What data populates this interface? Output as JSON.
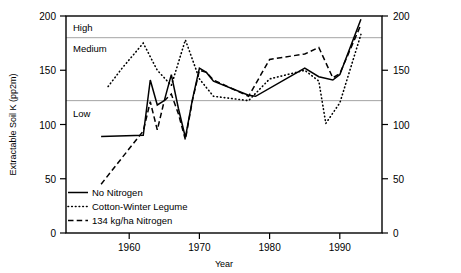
{
  "chart_data": {
    "type": "line",
    "title": "",
    "xlabel": "Year",
    "ylabel": "Extractable Soil K (pp2m)",
    "xlim": [
      1951,
      1996
    ],
    "ylim": [
      0,
      200
    ],
    "xticks": [
      1960,
      1970,
      1980,
      1990
    ],
    "yticks": [
      0,
      50,
      100,
      150,
      200
    ],
    "yticks_right": [
      0,
      50,
      100,
      150,
      200
    ],
    "grid": "horizontal gridlines at 122 and 180",
    "legend_position": "lower-left inside axes",
    "annotations": [
      {
        "label": "High",
        "y": 190,
        "note": "zone above 180 gridline"
      },
      {
        "label": "Medium",
        "y": 172,
        "note": "zone between 122 and 180"
      },
      {
        "label": "Low",
        "y": 110,
        "note": "zone below 122 gridline"
      }
    ],
    "zone_gridlines": [
      122,
      180
    ],
    "series": [
      {
        "name": "No Nitrogen",
        "style": "solid",
        "x": [
          1956,
          1962,
          1963,
          1964,
          1965,
          1966,
          1967,
          1968,
          1969,
          1970,
          1971,
          1972,
          1977,
          1978,
          1985,
          1987,
          1989,
          1990,
          1993
        ],
        "values": [
          89,
          90,
          141,
          118,
          122,
          146,
          115,
          88,
          123,
          152,
          148,
          140,
          127,
          126,
          152,
          144,
          141,
          146,
          197
        ]
      },
      {
        "name": "Cotton-Winter Legume",
        "style": "dotted",
        "x": [
          1957,
          1959,
          1962,
          1964,
          1966,
          1968,
          1970,
          1972,
          1977,
          1980,
          1985,
          1987,
          1988,
          1990,
          1993
        ],
        "values": [
          135,
          152,
          175,
          150,
          136,
          178,
          142,
          126,
          122,
          142,
          150,
          140,
          101,
          120,
          183
        ]
      },
      {
        "name": "134 kg/ha Nitrogen",
        "style": "dashed",
        "x": [
          1956,
          1962,
          1963,
          1964,
          1965,
          1966,
          1967,
          1968,
          1969,
          1970,
          1971,
          1972,
          1977,
          1980,
          1985,
          1987,
          1989,
          1990,
          1993
        ],
        "values": [
          45,
          94,
          121,
          95,
          122,
          128,
          110,
          86,
          122,
          150,
          148,
          141,
          126,
          160,
          165,
          171,
          143,
          147,
          192
        ]
      }
    ]
  },
  "legend": {
    "items": [
      {
        "label": "No Nitrogen",
        "style": "solid"
      },
      {
        "label": "Cotton-Winter Legume",
        "style": "dotted"
      },
      {
        "label": "134 kg/ha Nitrogen",
        "style": "dashed"
      }
    ]
  },
  "axes": {
    "y_title": "Extractable Soil K (pp2m)",
    "x_title": "Year",
    "y_tick_labels": [
      "0",
      "50",
      "100",
      "150",
      "200"
    ],
    "y_tick_labels_right": [
      "0",
      "50",
      "100",
      "150",
      "200"
    ],
    "x_tick_labels": [
      "1960",
      "1970",
      "1980",
      "1990"
    ]
  },
  "zones": {
    "high": "High",
    "medium": "Medium",
    "low": "Low"
  },
  "colors": {
    "line": "#000000",
    "grid": "#9a9a9a",
    "background": "#ffffff"
  }
}
